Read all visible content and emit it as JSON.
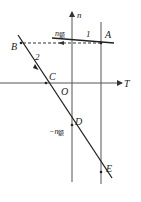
{
  "diagram": {
    "axes": {
      "x_label": "T",
      "y_label": "n",
      "origin_label": "O"
    },
    "labels": {
      "rated_top": "n",
      "rated_top_sub": "额",
      "rated_bottom_sign": "−n",
      "rated_bottom_sub": "额",
      "curve1": "1",
      "curve2": "2"
    },
    "points": {
      "A": "A",
      "B": "B",
      "C": "C",
      "D": "D",
      "E": "E"
    },
    "colors": {
      "line": "#222222",
      "axis": "#555555"
    }
  }
}
